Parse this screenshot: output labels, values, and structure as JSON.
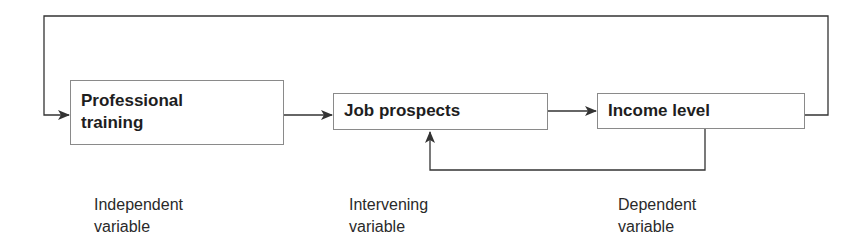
{
  "diagram": {
    "nodes": [
      {
        "id": "professional-training",
        "line1": "Professional",
        "line2": "training"
      },
      {
        "id": "job-prospects",
        "line1": "Job prospects"
      },
      {
        "id": "income-level",
        "line1": "Income level"
      }
    ],
    "labels": [
      {
        "line1": "Independent",
        "line2": "variable"
      },
      {
        "line1": "Intervening",
        "line2": "variable"
      },
      {
        "line1": "Dependent",
        "line2": "variable"
      }
    ],
    "edges": [
      {
        "from": "professional-training",
        "to": "job-prospects"
      },
      {
        "from": "job-prospects",
        "to": "income-level"
      },
      {
        "from": "income-level",
        "to": "job-prospects",
        "type": "feedback"
      },
      {
        "from": "income-level",
        "to": "professional-training",
        "type": "feedback-loop"
      }
    ],
    "colors": {
      "line": "#333333",
      "box_border": "#8a8a8a",
      "text": "#1e1e1e"
    }
  }
}
